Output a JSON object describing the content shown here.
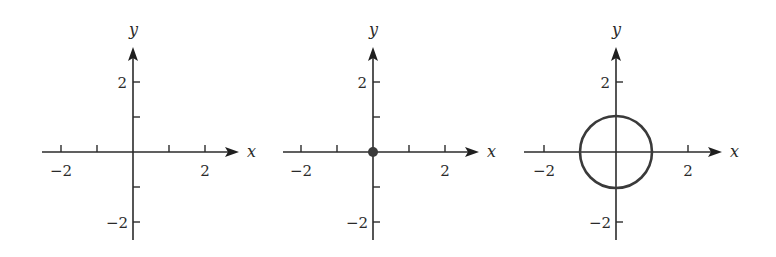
{
  "figure": {
    "panels": [
      {
        "id": "axes-only",
        "x_label": "x",
        "y_label": "y",
        "x_tick_labels": [
          "−2",
          "2"
        ],
        "y_tick_labels": [
          "2",
          "−2"
        ],
        "content": "none"
      },
      {
        "id": "point-origin",
        "x_label": "x",
        "y_label": "y",
        "x_tick_labels": [
          "−2",
          "2"
        ],
        "y_tick_labels": [
          "2",
          "−2"
        ],
        "content": "point",
        "point": {
          "x": 0,
          "y": 0
        }
      },
      {
        "id": "unit-circle",
        "x_label": "x",
        "y_label": "y",
        "x_tick_labels": [
          "−2",
          "2"
        ],
        "y_tick_labels": [
          "2",
          "−2"
        ],
        "content": "circle",
        "circle": {
          "cx": 0,
          "cy": 0,
          "r": 1
        }
      }
    ],
    "axis_range": {
      "x": [
        -2.5,
        2.9
      ],
      "y": [
        -2.4,
        2.9
      ]
    },
    "ticks": [
      -2,
      -1,
      1,
      2
    ],
    "colors": {
      "axis": "#2b2b2b",
      "curve": "#3a3a3a"
    }
  }
}
